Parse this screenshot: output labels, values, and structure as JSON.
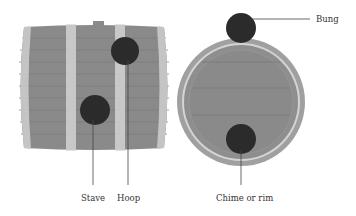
{
  "diagram": {
    "views": [
      {
        "id": "side-view",
        "callouts": [
          {
            "id": "stave",
            "label": "Stave"
          },
          {
            "id": "hoop",
            "label": "Hoop"
          }
        ]
      },
      {
        "id": "top-view",
        "callouts": [
          {
            "id": "bung",
            "label": "Bung"
          },
          {
            "id": "chime",
            "label": "Chime or rim"
          }
        ]
      }
    ],
    "colors": {
      "stave_fill": "#8a8a8a",
      "stave_line": "#7c7c7c",
      "hoop_fill": "#c8c8c8",
      "marker_fill": "#2b2b2b",
      "leader_line": "#444444",
      "head_outer": "#a0a0a0",
      "head_ring": "#d4d4d4",
      "head_inner": "#8e8e8e"
    }
  }
}
